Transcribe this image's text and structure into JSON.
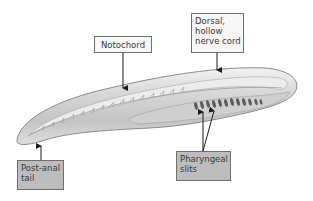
{
  "diagram": {
    "labels": {
      "notochord": {
        "lines": [
          "Notochord"
        ]
      },
      "nerve_cord": {
        "lines": [
          "Dorsal,",
          "hollow",
          "nerve cord"
        ]
      },
      "post_anal_tail": {
        "lines": [
          "Post-anal",
          "tail"
        ]
      },
      "pharyngeal_slits": {
        "lines": [
          "Pharyngeal",
          "slits"
        ]
      }
    },
    "colors": {
      "background": "#ffffff",
      "body_fill": "#d9d9d9",
      "body_outline": "#8a8a8a",
      "slit_color": "#5a5a5a",
      "light_label_fill": "#f7f7f7",
      "dark_label_fill": "#bdbdbd",
      "arrow": "#1a1a1a"
    }
  }
}
